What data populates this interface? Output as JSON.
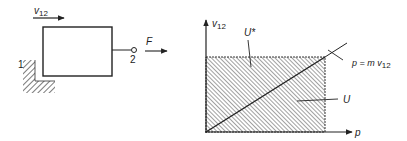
{
  "left_diagram": {
    "velocity_label": "v",
    "velocity_sub": "12",
    "node_1_label": "1",
    "node_2_label": "2",
    "force_label": "F"
  },
  "right_diagram": {
    "y_axis_label": "v",
    "y_axis_sub": "12",
    "x_axis_label": "p",
    "region_upper_label": "U*",
    "region_lower_label": "U",
    "line_label_prefix": "p = m v",
    "line_label_sub": "12"
  },
  "colors": {
    "ink": "#222222",
    "background": "#ffffff"
  }
}
